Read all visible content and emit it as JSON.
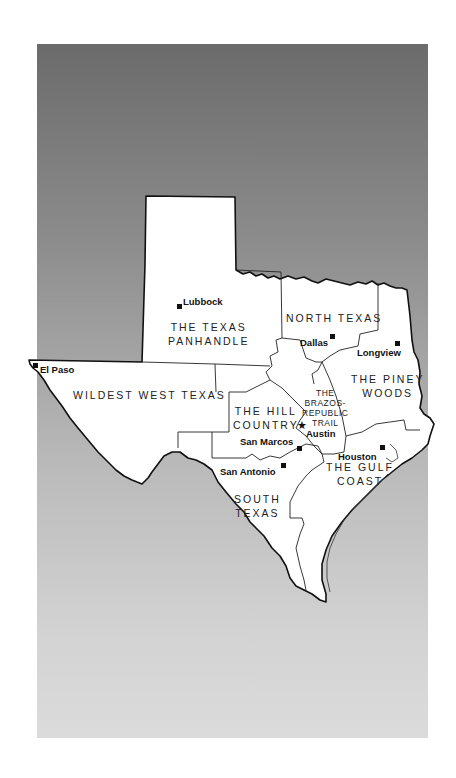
{
  "map": {
    "title": "Texas regions",
    "colors": {
      "panel_top": "#6b6b6b",
      "panel_bottom": "#dbdbdb",
      "land": "#ffffff",
      "border": "#111111"
    },
    "regions": [
      {
        "id": "panhandle",
        "lines": [
          "THE TEXAS",
          "PANHANDLE"
        ]
      },
      {
        "id": "north-texas",
        "lines": [
          "NORTH TEXAS"
        ]
      },
      {
        "id": "piney-woods",
        "lines": [
          "THE PINEY",
          "WOODS"
        ]
      },
      {
        "id": "wildest-west",
        "lines": [
          "WILDEST WEST TEXAS"
        ]
      },
      {
        "id": "hill-country",
        "lines": [
          "THE HILL",
          "COUNTRY"
        ]
      },
      {
        "id": "brazos",
        "lines": [
          "THE",
          "BRAZOS-",
          "REPUBLIC",
          "TRAIL"
        ]
      },
      {
        "id": "gulf-coast",
        "lines": [
          "THE GULF",
          "COAST"
        ]
      },
      {
        "id": "south-texas",
        "lines": [
          "SOUTH",
          "TEXAS"
        ]
      }
    ],
    "cities": [
      {
        "name": "Lubbock",
        "marker": "square"
      },
      {
        "name": "Dallas",
        "marker": "square"
      },
      {
        "name": "Longview",
        "marker": "square"
      },
      {
        "name": "El Paso",
        "marker": "square"
      },
      {
        "name": "Austin",
        "marker": "star"
      },
      {
        "name": "San Marcos",
        "marker": "square"
      },
      {
        "name": "San Antonio",
        "marker": "square"
      },
      {
        "name": "Houston",
        "marker": "square"
      }
    ]
  }
}
